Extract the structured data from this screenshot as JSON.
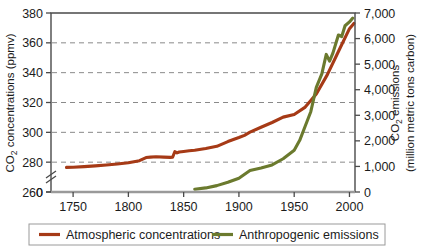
{
  "chart_data": {
    "type": "line",
    "title": "",
    "xlabel": "",
    "xlim": [
      1730,
      2005
    ],
    "xticks": [
      1750,
      1800,
      1850,
      1900,
      1950,
      2000
    ],
    "xticklabels": [
      "1750",
      "1800",
      "1850",
      "1900",
      "1950",
      "2000"
    ],
    "grid": true,
    "grid_style": "dashed-horizontal",
    "legend_position": "below-axes",
    "axis_break": {
      "present": true,
      "axis": "left",
      "between": [
        0,
        260
      ],
      "symbol": "//"
    },
    "left_axis": {
      "label_line1": "CO",
      "label_sub": "2",
      "label_line2": " concentrations (ppmv)",
      "label_full": "CO2 concentrations (ppmv)",
      "ylim": [
        260,
        380
      ],
      "yticks": [
        260,
        280,
        300,
        320,
        340,
        360,
        380
      ],
      "yticklabels": [
        "260",
        "280",
        "300",
        "320",
        "340",
        "360",
        "380"
      ],
      "zero_tick_label": "0",
      "unit": "ppmv"
    },
    "right_axis": {
      "label_line1": "CO",
      "label_sub": "2",
      "label_line1_rest": " emissions",
      "label_line2": "(million metric tons carbon)",
      "label_full": "CO2 emissions (million metric tons carbon)",
      "ylim": [
        0,
        7000
      ],
      "yticks": [
        0,
        1000,
        2000,
        3000,
        4000,
        5000,
        6000,
        7000
      ],
      "yticklabels": [
        "0",
        "1,000",
        "2,000",
        "3,000",
        "4,000",
        "5,000",
        "6,000",
        "7,000"
      ],
      "unit": "million metric tons carbon"
    },
    "series": [
      {
        "name": "Atmospheric concentrations",
        "axis": "left",
        "color": "#A63A16",
        "x": [
          1744,
          1750,
          1760,
          1770,
          1780,
          1790,
          1800,
          1810,
          1816,
          1820,
          1825,
          1832,
          1838,
          1840,
          1842,
          1844,
          1846,
          1850,
          1855,
          1860,
          1870,
          1880,
          1890,
          1900,
          1905,
          1910,
          1920,
          1930,
          1940,
          1950,
          1960,
          1970,
          1980,
          1990,
          2000,
          2004
        ],
        "y": [
          276.5,
          276.6,
          277.0,
          277.5,
          278.1,
          278.8,
          279.6,
          281.0,
          283.1,
          283.4,
          283.6,
          283.4,
          283.2,
          283.3,
          287.0,
          286.2,
          286.8,
          287.2,
          287.6,
          288.0,
          289.2,
          290.6,
          293.8,
          296.5,
          298.0,
          300.1,
          303.4,
          306.6,
          310.2,
          312.0,
          316.9,
          325.7,
          338.7,
          354.2,
          369.5,
          373.0
        ],
        "note": "Ice core + Mauna Loa record; step-like rise near 1840"
      },
      {
        "name": "Anthropogenic emissions",
        "axis": "right",
        "color": "#6B7A2E",
        "x": [
          1860,
          1870,
          1880,
          1890,
          1900,
          1910,
          1920,
          1930,
          1940,
          1950,
          1955,
          1960,
          1965,
          1970,
          1975,
          1979,
          1982,
          1985,
          1990,
          1993,
          1996,
          2000,
          2003
        ],
        "y": [
          110,
          160,
          250,
          380,
          540,
          840,
          940,
          1060,
          1300,
          1630,
          2020,
          2580,
          3140,
          4090,
          4620,
          5380,
          5120,
          5430,
          6140,
          6080,
          6500,
          6650,
          6800
        ],
        "note": "Fossil fuel CO2 emissions; plateau dips near 1980 and 1991"
      }
    ]
  },
  "legend": {
    "items": [
      {
        "label": "Atmospheric concentrations",
        "color": "#A63A16"
      },
      {
        "label": "Anthropogenic emissions",
        "color": "#6B7A2E"
      }
    ]
  }
}
